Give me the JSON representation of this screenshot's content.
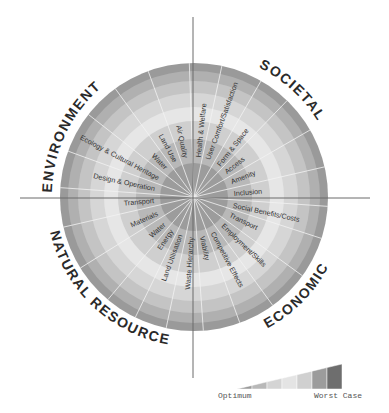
{
  "diagram": {
    "center": [
      194,
      197
    ],
    "radius": 134,
    "rings": [
      {
        "r": 134,
        "color": "#9a9a9a"
      },
      {
        "r": 126,
        "color": "#b0b0b0"
      },
      {
        "r": 116,
        "color": "#c4c4c4"
      },
      {
        "r": 104,
        "color": "#d6d6d6"
      },
      {
        "r": 90,
        "color": "#e6e6e6"
      },
      {
        "r": 76,
        "color": "#cfcfcf"
      },
      {
        "r": 58,
        "color": "#b8b8b8"
      },
      {
        "r": 34,
        "color": "#9c9c9c"
      }
    ],
    "categories": [
      {
        "id": "environment",
        "label": "ENVIRONMENT"
      },
      {
        "id": "societal",
        "label": "SOCIETAL"
      },
      {
        "id": "economic",
        "label": "ECONOMIC"
      },
      {
        "id": "natural_resources",
        "label": "NATURAL RESOURCES"
      }
    ],
    "spokes": [
      {
        "label": "Health & Welfare",
        "angle": -84
      },
      {
        "label": "User Comfort/Satisfaction",
        "angle": -70
      },
      {
        "label": "Form & Space",
        "angle": -52
      },
      {
        "label": "Access",
        "angle": -38
      },
      {
        "label": "Amenity",
        "angle": -22
      },
      {
        "label": "Inclusion",
        "angle": -5
      },
      {
        "label": "Social Benefits/Costs",
        "angle": 12
      },
      {
        "label": "Transport",
        "angle": 26
      },
      {
        "label": "Employment/Skills",
        "angle": 44
      },
      {
        "label": "Competitive Effects",
        "angle": 62
      },
      {
        "label": "Viability",
        "angle": 78
      },
      {
        "label": "Waste Hierarchy",
        "angle": 94
      },
      {
        "label": "Land Utilisation",
        "angle": 110
      },
      {
        "label": "Energy",
        "angle": 124
      },
      {
        "label": "Water",
        "angle": 138
      },
      {
        "label": "Materials",
        "angle": 156
      },
      {
        "label": "Transport",
        "angle": 175
      },
      {
        "label": "Design & Operation",
        "angle": 192
      },
      {
        "label": "Ecology & Cultural Heritage",
        "angle": 208
      },
      {
        "label": "Water",
        "angle": 226
      },
      {
        "label": "Land Use",
        "angle": 242
      },
      {
        "label": "Air Quality",
        "angle": 258
      }
    ]
  },
  "legend": {
    "min_label": "Optimum",
    "max_label": "Worst Case",
    "steps": [
      "#9a9a9a",
      "#b8b8b8",
      "#d4d4d4",
      "#e4e4e4",
      "#d0d0d0",
      "#9c9c9c",
      "#6e6e6e"
    ]
  }
}
